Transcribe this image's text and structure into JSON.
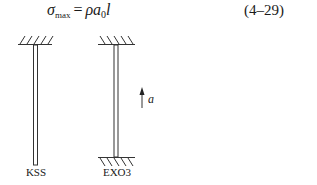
{
  "equation": {
    "sigma": "σ",
    "sigma_sub": "max",
    "equals": "=",
    "rho": "ρ",
    "a": "a",
    "a_sub": "0",
    "l": "l",
    "number": "(4–29)"
  },
  "figure": {
    "rods": [
      {
        "label": "KSS",
        "fixed_top": true,
        "fixed_bottom": false
      },
      {
        "label": "EXO3",
        "fixed_top": true,
        "fixed_bottom": true
      }
    ],
    "arrow": {
      "label": "a",
      "direction": "up"
    }
  }
}
